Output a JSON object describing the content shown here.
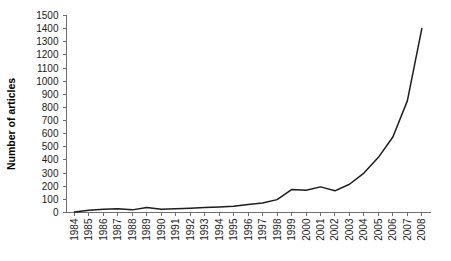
{
  "chart_data": {
    "type": "line",
    "title": "",
    "xlabel": "",
    "ylabel": "Number of articles",
    "ylim": [
      0,
      1500
    ],
    "ytick_step": 100,
    "grid": false,
    "legend": null,
    "line_color": "#1c1c1c",
    "axis_color": "#6e6e6e",
    "categories": [
      "1984",
      "1985",
      "1986",
      "1987",
      "1988",
      "1989",
      "1990",
      "1991",
      "1992",
      "1993",
      "1994",
      "1995",
      "1996",
      "1997",
      "1998",
      "1999",
      "2000",
      "2001",
      "2002",
      "2003",
      "2004",
      "2005",
      "2006",
      "2007",
      "2008"
    ],
    "series": [
      {
        "name": "Number of articles",
        "values": [
          3,
          18,
          25,
          28,
          20,
          38,
          25,
          28,
          33,
          38,
          42,
          48,
          60,
          72,
          98,
          175,
          170,
          195,
          165,
          215,
          300,
          420,
          575,
          850,
          1400
        ]
      }
    ],
    "yticks": [
      "0",
      "100",
      "200",
      "300",
      "400",
      "500",
      "600",
      "700",
      "800",
      "900",
      "1000",
      "1100",
      "1200",
      "1300",
      "1400",
      "1500"
    ]
  }
}
